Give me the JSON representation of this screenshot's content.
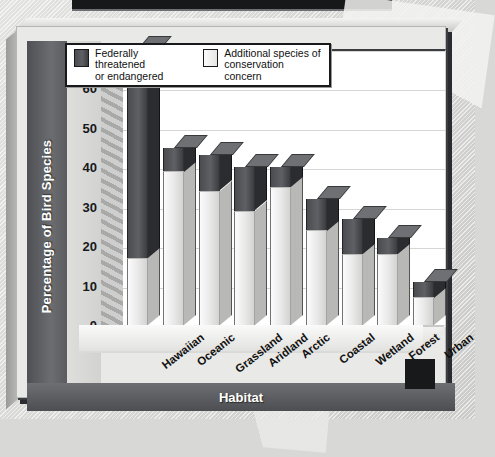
{
  "chart_data": {
    "type": "bar",
    "subtype": "stacked-3d-column",
    "title": "",
    "xlabel": "Habitat",
    "ylabel": "Percentage of Bird Species",
    "ylim": [
      0,
      70
    ],
    "ytick_step": 10,
    "yticks": [
      "70",
      "60",
      "50",
      "40",
      "30",
      "20",
      "10",
      "0"
    ],
    "grid": true,
    "grid_axis": "y",
    "legend_position": "top-center-inside",
    "categories": [
      "Hawaiian",
      "Oceanic",
      "Grassland",
      "Aridland",
      "Arctic",
      "Coastal",
      "Wetland",
      "Forest",
      "Urban"
    ],
    "series": [
      {
        "name": "Additional species of conservation concern",
        "color": "#eaeaea",
        "values": [
          17,
          39,
          34,
          29,
          35,
          24,
          18,
          18,
          7
        ]
      },
      {
        "name": "Federally threatened or endangered",
        "color": "#4a4c4f",
        "values": [
          53,
          6,
          9,
          11,
          5,
          8,
          9,
          4,
          4
        ]
      }
    ],
    "totals": [
      70,
      45,
      43,
      40,
      40,
      32,
      27,
      22,
      11
    ]
  },
  "axes": {
    "y_title": "Percentage of Bird Species",
    "x_title": "Habitat",
    "y_ticks": [
      "70",
      "60",
      "50",
      "40",
      "30",
      "20",
      "10",
      "0"
    ],
    "x_ticks": [
      "Hawaiian",
      "Oceanic",
      "Grassland",
      "Aridland",
      "Arctic",
      "Coastal",
      "Wetland",
      "Forest",
      "Urban"
    ]
  },
  "legend": {
    "items": [
      {
        "label": "Federally threatened\nor endangered",
        "swatch": "dark"
      },
      {
        "label": "Additional species of\nconservation concern",
        "swatch": "light"
      }
    ]
  },
  "colors": {
    "dark_series": "#4a4c4f",
    "light_series": "#eaeaea",
    "axis_band": "#5a5c5f",
    "plot_background": "#ffffff",
    "page_background": "#dcdcda"
  }
}
